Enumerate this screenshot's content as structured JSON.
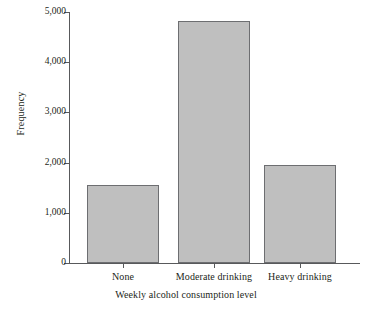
{
  "chart_data": {
    "type": "bar",
    "title": "",
    "subtitle": "",
    "xlabel": "Weekly alcohol consumption level",
    "ylabel": "Frequency",
    "categories": [
      "None",
      "Moderate drinking",
      "Heavy drinking"
    ],
    "values": [
      1550,
      4820,
      1950
    ],
    "series": [
      {
        "name": "Frequency",
        "values": [
          1550,
          4820,
          1950
        ]
      }
    ],
    "ylim": [
      0,
      5000
    ],
    "yticks": [
      0,
      1000,
      2000,
      3000,
      4000,
      5000
    ],
    "ytick_labels": [
      "0",
      "1,000",
      "2,000",
      "3,000",
      "4,000",
      "5,000"
    ],
    "grid": false,
    "legend": false,
    "legend_position": "none",
    "bar_fill_color": "#bfbfbf",
    "bar_edge_color": "#6d6e71",
    "axis_color": "#58595b",
    "background_color": "#ffffff",
    "text_color": "#231f20"
  }
}
